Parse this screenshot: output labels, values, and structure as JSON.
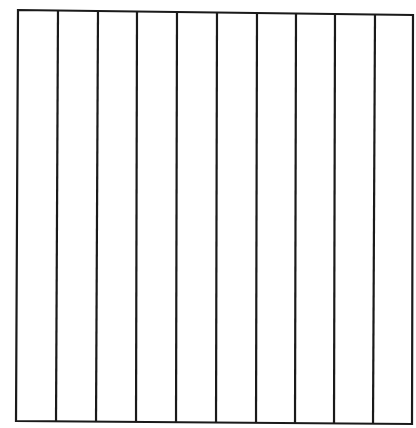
{
  "diagram": {
    "type": "column-grid",
    "columns": 10,
    "stroke_color": "#1a1a1a",
    "stroke_width": 2.2,
    "background": "#ffffff",
    "outline": {
      "top_left": [
        18,
        10
      ],
      "top_right": [
        413,
        15
      ],
      "bottom_right": [
        412,
        424
      ],
      "bottom_left": [
        16,
        421
      ]
    },
    "dividers": [
      {
        "top": [
          58,
          11
        ],
        "bottom": [
          56,
          421
        ]
      },
      {
        "top": [
          98,
          11
        ],
        "bottom": [
          96,
          422
        ]
      },
      {
        "top": [
          137,
          12
        ],
        "bottom": [
          136,
          422
        ]
      },
      {
        "top": [
          177,
          12
        ],
        "bottom": [
          176,
          422
        ]
      },
      {
        "top": [
          217,
          13
        ],
        "bottom": [
          216,
          423
        ]
      },
      {
        "top": [
          257,
          13
        ],
        "bottom": [
          256,
          423
        ]
      },
      {
        "top": [
          296,
          14
        ],
        "bottom": [
          295,
          423
        ]
      },
      {
        "top": [
          335,
          14
        ],
        "bottom": [
          334,
          423
        ]
      },
      {
        "top": [
          375,
          15
        ],
        "bottom": [
          373,
          424
        ]
      }
    ]
  }
}
